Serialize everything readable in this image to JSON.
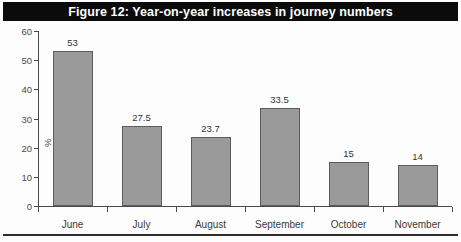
{
  "figure": {
    "title": "Figure 12: Year-on-year increases in journey numbers",
    "title_bar_color": "#0b0b0b",
    "title_text_color": "#ffffff"
  },
  "chart_data": {
    "type": "bar",
    "title": "Figure 12: Year-on-year increases in journey numbers",
    "categories": [
      "June",
      "July",
      "August",
      "September",
      "October",
      "November"
    ],
    "values": [
      53,
      27.5,
      23.7,
      33.5,
      15,
      14
    ],
    "value_labels": [
      "53",
      "27.5",
      "23.7",
      "33.5",
      "15",
      "14"
    ],
    "xlabel": "",
    "ylabel": "%",
    "ylim": [
      0,
      60
    ],
    "yticks": [
      0,
      10,
      20,
      30,
      40,
      50,
      60
    ],
    "ytick_labels": [
      "0",
      "10",
      "20",
      "30",
      "40",
      "50",
      "60"
    ],
    "grid": false,
    "legend": null,
    "bar_color": "#9a9a9a",
    "bar_edge_color": "#5d5d5d",
    "axis_color": "#4a4a4a"
  }
}
